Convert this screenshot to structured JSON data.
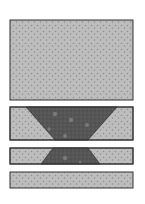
{
  "diagram": {
    "colors": {
      "background": "#ffffff",
      "light_fill": "#bdbdbd",
      "light_speckle": "#8f8f8f",
      "dark_fill": "#5a5a5a",
      "dark_speckle": "#7a7a7a",
      "outline": "#333333"
    },
    "layers": [
      {
        "name": "top-block",
        "x": 10,
        "y": 20,
        "w": 123,
        "h": 80,
        "inclusion": null
      },
      {
        "name": "layer-2",
        "x": 10,
        "y": 107,
        "w": 123,
        "h": 33,
        "inclusion": {
          "type": "trapezoid",
          "top_left": 26,
          "top_right": 117,
          "bottom_left": 55,
          "bottom_right": 88
        }
      },
      {
        "name": "layer-3",
        "x": 10,
        "y": 148,
        "w": 123,
        "h": 16,
        "inclusion": {
          "type": "trapezoid",
          "top_left": 53,
          "top_right": 88,
          "bottom_left": 41,
          "bottom_right": 100
        }
      },
      {
        "name": "layer-4",
        "x": 10,
        "y": 172,
        "w": 123,
        "h": 16,
        "inclusion": null
      }
    ]
  }
}
